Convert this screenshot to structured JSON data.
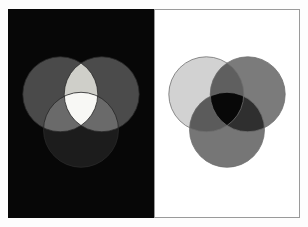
{
  "figure": {
    "panels": [
      {
        "id": "additive",
        "name": "Additive colour mixing",
        "background_color": "#070707",
        "border_color": "#070707",
        "blend_mode": "screen",
        "center_result_color": "#f8f8f5",
        "circles": [
          {
            "name": "top-left-circle",
            "cx": 52,
            "cy": 85,
            "r": 38,
            "fill": "#4a4a4a"
          },
          {
            "name": "top-right-circle",
            "cx": 94,
            "cy": 85,
            "r": 38,
            "fill": "#4b4b4b"
          },
          {
            "name": "bottom-circle",
            "cx": 73,
            "cy": 121,
            "r": 38,
            "fill": "#1c1c1c"
          }
        ],
        "overlap_colors": {
          "top_pair": "#cfcfc9",
          "left_pair": "#6a6a6a",
          "right_pair": "#6a6a6a",
          "triple": "#f8f8f5"
        }
      },
      {
        "id": "subtractive",
        "name": "Subtractive colour mixing",
        "background_color": "#ffffff",
        "border_color": "#9a9a9a",
        "blend_mode": "multiply",
        "center_result_color": "#080808",
        "circles": [
          {
            "name": "top-left-circle",
            "cx": 52,
            "cy": 85,
            "r": 38,
            "fill": "#d2d2d2"
          },
          {
            "name": "top-right-circle",
            "cx": 94,
            "cy": 85,
            "r": 38,
            "fill": "#7b7b7b"
          },
          {
            "name": "bottom-circle",
            "cx": 73,
            "cy": 121,
            "r": 38,
            "fill": "#767676"
          }
        ],
        "overlap_colors": {
          "top_pair": "#5f5f5f",
          "left_pair": "#5b5b5b",
          "right_pair": "#2f2f2f",
          "triple": "#080808"
        },
        "outline_color": "#6e6e6e"
      }
    ]
  },
  "chart_data": {
    "type": "diagram",
    "subtype": "venn-three-circle-colour-mixing",
    "panel_count": 2,
    "panels": [
      {
        "label": "Additive (light) mixing on black",
        "background": "#070707",
        "regions": [
          {
            "region": "top-left only",
            "gray_value": "#4a4a4a"
          },
          {
            "region": "top-right only",
            "gray_value": "#4b4b4b"
          },
          {
            "region": "bottom only",
            "gray_value": "#1c1c1c"
          },
          {
            "region": "top-left + top-right",
            "gray_value": "#cfcfc9"
          },
          {
            "region": "top-left + bottom",
            "gray_value": "#6a6a6a"
          },
          {
            "region": "top-right + bottom",
            "gray_value": "#6a6a6a"
          },
          {
            "region": "all three",
            "gray_value": "#f8f8f5"
          }
        ]
      },
      {
        "label": "Subtractive (pigment) mixing on white",
        "background": "#ffffff",
        "regions": [
          {
            "region": "top-left only",
            "gray_value": "#d2d2d2"
          },
          {
            "region": "top-right only",
            "gray_value": "#7b7b7b"
          },
          {
            "region": "bottom only",
            "gray_value": "#767676"
          },
          {
            "region": "top-left + top-right",
            "gray_value": "#5f5f5f"
          },
          {
            "region": "top-left + bottom",
            "gray_value": "#5b5b5b"
          },
          {
            "region": "top-right + bottom",
            "gray_value": "#2f2f2f"
          },
          {
            "region": "all three",
            "gray_value": "#080808"
          }
        ]
      }
    ]
  }
}
